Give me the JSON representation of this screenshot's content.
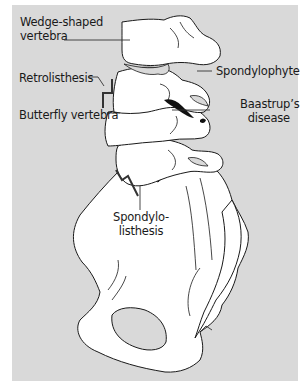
{
  "figure": {
    "background_color": "#d9d9d9",
    "bone_fill": "#ffffff",
    "outline_color": "#1a1a1a",
    "labels": {
      "wedge_line1": "Wedge-shaped",
      "wedge_line2": "vertebra",
      "retrolisthesis": "Retrolisthesis",
      "butterfly": "Butterfly vertebra",
      "spondylophyte": "Spondylophyte",
      "baastrup_line1": "Baastrup’s",
      "baastrup_line2": "disease",
      "spondylo_line1": "Spondylo-",
      "spondylo_line2": "listhesis"
    },
    "markers": [
      "retrolisthesis-step",
      "spondylolisthesis-step",
      "baastrup-contact"
    ]
  }
}
